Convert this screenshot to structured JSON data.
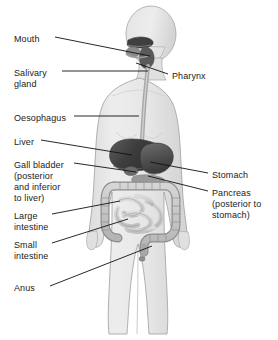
{
  "diagram": {
    "view": "anterior full-body silhouette",
    "background_color": "#ffffff",
    "body_fill": "#e8e8e8",
    "body_outline": "#9a9a9a",
    "organ_dark": "#4a4a4a",
    "organ_mid": "#8c8c8c",
    "organ_light": "#c9c9c9",
    "leader_color": "#111111",
    "text_color": "#1a1a1a"
  },
  "labels": {
    "left": [
      {
        "id": "mouth",
        "text": "Mouth",
        "x": 14,
        "y": 34
      },
      {
        "id": "salivary_gland",
        "text": "Salivary\ngland",
        "x": 14,
        "y": 68
      },
      {
        "id": "oesophagus",
        "text": "Oesophagus",
        "x": 14,
        "y": 113
      },
      {
        "id": "liver",
        "text": "Liver",
        "x": 14,
        "y": 137
      },
      {
        "id": "gall_bladder",
        "text": "Gall bladder\n(posterior\nand inferior\nto liver)",
        "x": 14,
        "y": 160
      },
      {
        "id": "large_intestine",
        "text": "Large\nintestine",
        "x": 14,
        "y": 211
      },
      {
        "id": "small_intestine",
        "text": "Small\nintestine",
        "x": 14,
        "y": 240
      },
      {
        "id": "anus",
        "text": "Anus",
        "x": 14,
        "y": 283
      }
    ],
    "right": [
      {
        "id": "pharynx",
        "text": "Pharynx",
        "x": 172,
        "y": 71
      },
      {
        "id": "stomach",
        "text": "Stomach",
        "x": 212,
        "y": 170
      },
      {
        "id": "pancreas",
        "text": "Pancreas\n(posterior to\nstomach)",
        "x": 212,
        "y": 188
      }
    ]
  },
  "leader_lines": [
    {
      "id": "mouth-leader",
      "from": [
        55,
        37
      ],
      "to": [
        150,
        56
      ]
    },
    {
      "id": "salivary-leader",
      "from": [
        62,
        71
      ],
      "to": [
        148,
        71
      ]
    },
    {
      "id": "oesophagus-leader",
      "from": [
        74,
        116
      ],
      "to": [
        139,
        116
      ]
    },
    {
      "id": "liver-leader",
      "from": [
        41,
        140
      ],
      "to": [
        132,
        155
      ]
    },
    {
      "id": "gallbladder-leader",
      "from": [
        74,
        163
      ],
      "to": [
        136,
        172
      ]
    },
    {
      "id": "large-intestine-leader",
      "from": [
        52,
        214
      ],
      "to": [
        120,
        201
      ]
    },
    {
      "id": "small-intestine-leader",
      "from": [
        52,
        243
      ],
      "to": [
        128,
        219
      ]
    },
    {
      "id": "anus-leader",
      "from": [
        50,
        286
      ],
      "to": [
        152,
        246
      ]
    },
    {
      "id": "pharynx-leader",
      "from": [
        168,
        74
      ],
      "to": [
        136,
        63
      ]
    },
    {
      "id": "stomach-leader",
      "from": [
        208,
        173
      ],
      "to": [
        150,
        162
      ]
    },
    {
      "id": "pancreas-leader",
      "from": [
        208,
        191
      ],
      "to": [
        148,
        176
      ]
    }
  ],
  "organs": [
    {
      "id": "mouth-cavity",
      "name": "mouth",
      "shade": "#3f3f3f"
    },
    {
      "id": "pharynx-region",
      "name": "pharynx",
      "shade": "#5a5a5a"
    },
    {
      "id": "salivary-gland-region",
      "name": "salivary-gland",
      "shade": "#6e6e6e"
    },
    {
      "id": "oesophagus-tube",
      "name": "oesophagus",
      "shade": "#a8a8a8"
    },
    {
      "id": "liver-organ",
      "name": "liver",
      "shade": "#4a4a4a"
    },
    {
      "id": "stomach-organ",
      "name": "stomach",
      "shade": "#5c5c5c"
    },
    {
      "id": "gall-bladder-organ",
      "name": "gall-bladder",
      "shade": "#6a6a6a"
    },
    {
      "id": "pancreas-organ",
      "name": "pancreas",
      "shade": "#9a9a9a"
    },
    {
      "id": "large-intestine-organ",
      "name": "large-intestine",
      "shade": "#bdbdbd"
    },
    {
      "id": "small-intestine-organ",
      "name": "small-intestine",
      "shade": "#cccccc"
    },
    {
      "id": "rectum-anus",
      "name": "anus",
      "shade": "#b0b0b0"
    }
  ]
}
